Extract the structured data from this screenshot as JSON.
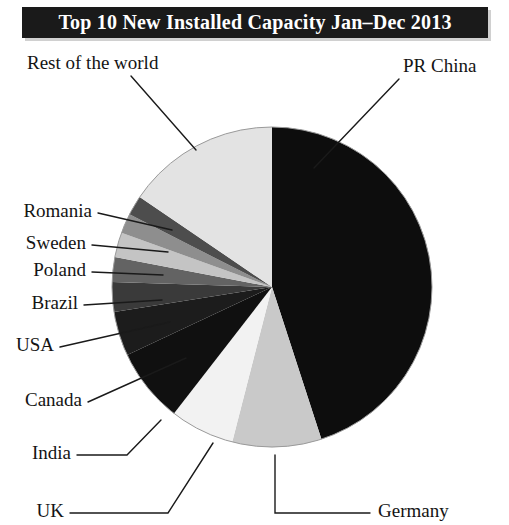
{
  "title": {
    "text": "Top 10 New Installed Capacity Jan–Dec 2013",
    "banner_color": "#1a1a1a",
    "text_color": "#ffffff"
  },
  "chart_data": {
    "type": "pie",
    "title": "Top 10 New Installed Capacity Jan–Dec 2013",
    "xlabel": "",
    "ylabel": "",
    "legend_position": "none",
    "grid": false,
    "start_angle_deg": 0,
    "direction": "clockwise",
    "categories": [
      "PR China",
      "Germany",
      "UK",
      "India",
      "Canada",
      "USA",
      "Brazil",
      "Poland",
      "Sweden",
      "Romania",
      "Rest of the world"
    ],
    "values": [
      45.0,
      9.0,
      6.5,
      7.5,
      4.5,
      3.0,
      2.5,
      2.5,
      2.0,
      2.0,
      15.5
    ],
    "colors": [
      "#0d0d0d",
      "#c9c9c9",
      "#f2f2f2",
      "#101010",
      "#1c1c1c",
      "#3a3a3a",
      "#636363",
      "#c4c4c4",
      "#8e8e8e",
      "#4d4d4d",
      "#e3e3e3"
    ],
    "slices": [
      {
        "label": "PR China",
        "value": 45.0,
        "color": "#0d0d0d"
      },
      {
        "label": "Germany",
        "value": 9.0,
        "color": "#c9c9c9"
      },
      {
        "label": "UK",
        "value": 6.5,
        "color": "#f2f2f2"
      },
      {
        "label": "India",
        "value": 7.5,
        "color": "#101010"
      },
      {
        "label": "Canada",
        "value": 4.5,
        "color": "#1c1c1c"
      },
      {
        "label": "USA",
        "value": 3.0,
        "color": "#3a3a3a"
      },
      {
        "label": "Brazil",
        "value": 2.5,
        "color": "#636363"
      },
      {
        "label": "Poland",
        "value": 2.5,
        "color": "#c4c4c4"
      },
      {
        "label": "Sweden",
        "value": 2.0,
        "color": "#8e8e8e"
      },
      {
        "label": "Romania",
        "value": 2.0,
        "color": "#4d4d4d"
      },
      {
        "label": "Rest of the world",
        "value": 15.5,
        "color": "#e3e3e3"
      }
    ]
  },
  "labels": {
    "pr_china": "PR China",
    "germany": "Germany",
    "uk": "UK",
    "india": "India",
    "canada": "Canada",
    "usa": "USA",
    "brazil": "Brazil",
    "poland": "Poland",
    "sweden": "Sweden",
    "romania": "Romania",
    "rest_of_the_world": "Rest of the world"
  }
}
